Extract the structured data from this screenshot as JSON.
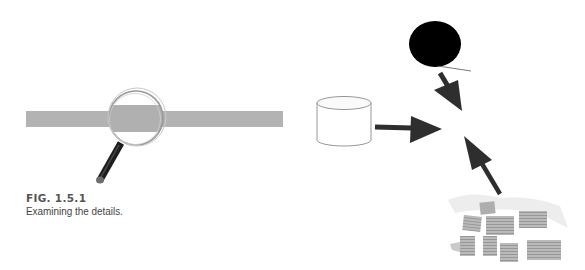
{
  "figure": {
    "label": "FIG. 1.5.1",
    "caption": "Examining the details."
  },
  "illustrations": {
    "left": {
      "description": "gray bar under magnifying glass",
      "icons": [
        "magnifying-glass-icon"
      ]
    },
    "right": {
      "description": "three sources converging on a central point",
      "icons": [
        "person-head-icon",
        "database-cylinder-icon",
        "document-pile-icon",
        "arrow-icon"
      ]
    }
  },
  "colors": {
    "bar": "#b3b3b3",
    "arrow": "#2e2e2e",
    "head": "#000000",
    "handle": "#1e1e1e",
    "document": "#a8a8a8",
    "caption": "#4a4a4a"
  }
}
